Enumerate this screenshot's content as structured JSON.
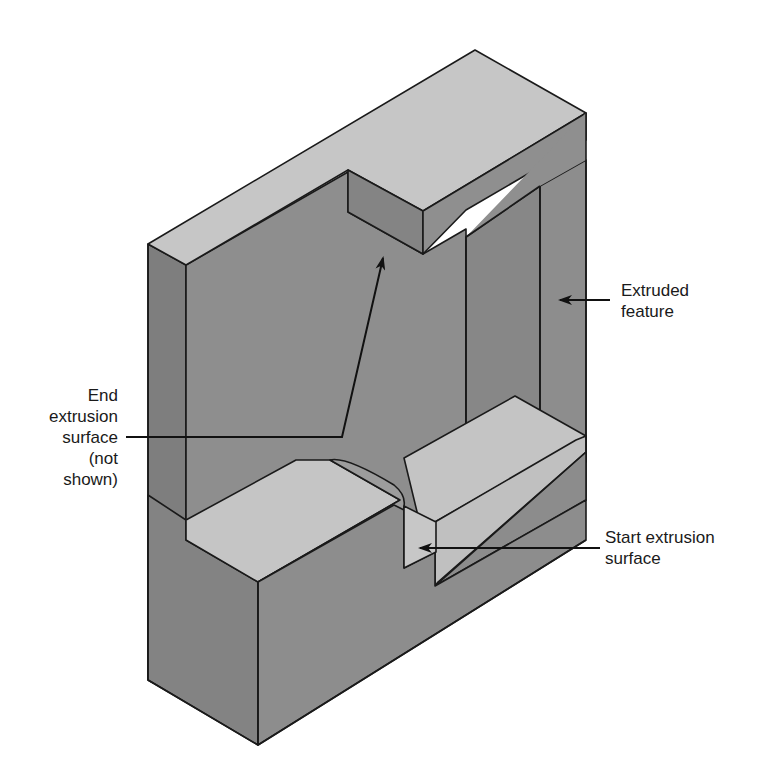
{
  "figure": {
    "colors": {
      "background": "#ffffff",
      "top_face": "#c4c4c4",
      "front_face": "#8e8e8e",
      "side_face": "#7a7a7a",
      "dark_face": "#858585",
      "outline": "#1a1a1a",
      "leader": "#111111"
    }
  },
  "labels": {
    "extruded_feature": {
      "lines": [
        "Extruded",
        "feature"
      ]
    },
    "end_extrusion_surface": {
      "lines": [
        "End",
        "extrusion",
        "surface",
        "(not",
        "shown)"
      ]
    },
    "start_extrusion_surface": {
      "lines": [
        "Start extrusion",
        "surface"
      ]
    }
  }
}
